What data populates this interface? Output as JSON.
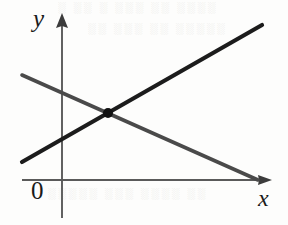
{
  "figure": {
    "caption_labels": {
      "y_axis": "y",
      "x_axis": "x",
      "origin": "0"
    },
    "artifacts": {
      "top_bleed": "░ ░░ ░ ░░░ ░░ ░░░░",
      "top_bleed_2": "░░ ░░░ ░░ ░░░░░",
      "bottom_bleed": "░░░░░ ░░░ ░░░░ ░░"
    }
  },
  "chart_data": {
    "type": "line",
    "title": "",
    "xlabel": "x",
    "ylabel": "y",
    "origin_label": "0",
    "grid": false,
    "legend": "none",
    "axes": {
      "x_axis": {
        "orientation": "horizontal",
        "pixel_y": 180,
        "pixel_x_start": 22,
        "pixel_x_end": 272,
        "arrow": "right",
        "color": "#5a5a5a"
      },
      "y_axis": {
        "orientation": "vertical",
        "pixel_x": 62,
        "pixel_y_start": 13,
        "pixel_y_end": 218,
        "arrow": "up",
        "color": "#5a5a5a"
      }
    },
    "series": [
      {
        "name": "increasing-line",
        "slope_sign": "positive",
        "color": "#1c1c1c",
        "width": 4.2,
        "points": [
          [
            22,
            162
          ],
          [
            262,
            25
          ]
        ]
      },
      {
        "name": "decreasing-line",
        "slope_sign": "negative",
        "color": "#4a4a4a",
        "width": 3.6,
        "points": [
          [
            22,
            75
          ],
          [
            258,
            180
          ]
        ]
      }
    ],
    "annotations": [
      {
        "name": "intersection-point",
        "type": "point",
        "pixel_x": 108,
        "pixel_y": 113,
        "radius": 5,
        "color": "#111111",
        "label": ""
      }
    ]
  }
}
